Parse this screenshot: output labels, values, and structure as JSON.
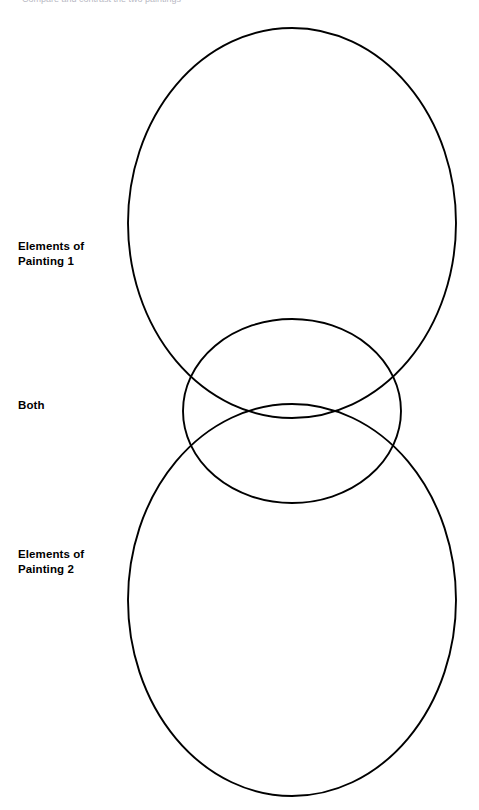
{
  "page": {
    "width": 479,
    "height": 810,
    "background_color": "#ffffff",
    "stroke_color": "#000000",
    "text_color": "#000000",
    "header_clipped_text": "Compare and contrast the two paintings"
  },
  "labels": {
    "top": "Elements of\nPainting 1",
    "middle": "Both",
    "bottom": "Elements of\nPainting 2"
  },
  "diagram": {
    "type": "venn-diagram",
    "shapes": [
      {
        "name": "upper-ellipse",
        "cx": 292,
        "cy": 223,
        "rx": 164,
        "ry": 195
      },
      {
        "name": "middle-circle",
        "cx": 292,
        "cy": 411,
        "rx": 109,
        "ry": 92
      },
      {
        "name": "lower-ellipse",
        "cx": 292,
        "cy": 600,
        "rx": 164,
        "ry": 196
      }
    ]
  }
}
